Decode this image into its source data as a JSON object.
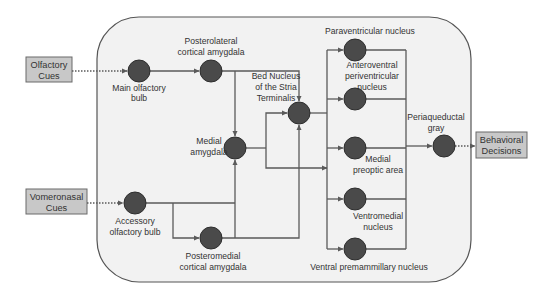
{
  "diagram": {
    "colors": {
      "background": "#ffffff",
      "panel_fill": "#f2f2f2",
      "panel_stroke": "#555555",
      "node_fill": "#4a4a4a",
      "node_stroke": "#2e2e2e",
      "line": "#5a5a5a",
      "input_box_fill": "#c8c8c8",
      "input_box_stroke": "#6a6a6a",
      "text": "#333333"
    },
    "inputs": {
      "olfactory": {
        "line1": "Olfactory",
        "line2": "Cues"
      },
      "vomeronasal": {
        "line1": "Vomeronasal",
        "line2": "Cues"
      }
    },
    "output": {
      "line1": "Behavioral",
      "line2": "Decisions"
    },
    "nodes": {
      "main_olfactory_bulb": {
        "line1": "Main olfactory",
        "line2": "bulb"
      },
      "posterolateral_cortical_amygdala": {
        "line1": "Posterolateral",
        "line2": "cortical amygdala"
      },
      "medial_amygdala": {
        "line1": "Medial",
        "line2": "amygdala"
      },
      "bnst": {
        "line1": "Bed Nucleus",
        "line2": "of the Stria",
        "line3": "Terminalis"
      },
      "accessory_olfactory_bulb": {
        "line1": "Accessory",
        "line2": "olfactory bulb"
      },
      "posteromedial_cortical_amygdala": {
        "line1": "Posteromedial",
        "line2": "cortical amygdala"
      },
      "paraventricular_nucleus": {
        "line1": "Paraventricular nucleus"
      },
      "anteroventral_periventricular_nucleus": {
        "line1": "Anteroventral",
        "line2": "periventricular",
        "line3": "nucleus"
      },
      "medial_preoptic_area": {
        "line1": "Medial",
        "line2": "preoptic area"
      },
      "ventromedial_nucleus": {
        "line1": "Ventromedial",
        "line2": "nucleus"
      },
      "ventral_premammillary_nucleus": {
        "line1": "Ventral premammillary nucleus"
      },
      "periaqueductal_gray": {
        "line1": "Periaqueductal",
        "line2": "gray"
      }
    }
  }
}
